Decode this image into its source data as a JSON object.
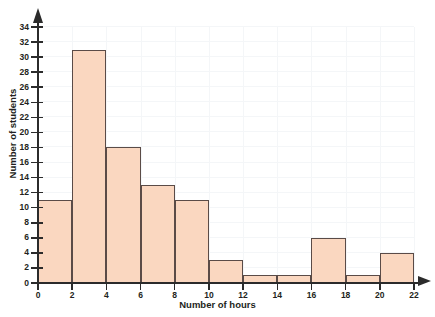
{
  "chart_data": {
    "type": "bar",
    "title": "",
    "subtitle": "",
    "xlabel": "Number of hours",
    "ylabel": "Number of students",
    "xlim": [
      0,
      22
    ],
    "ylim": [
      0,
      34
    ],
    "grid": true,
    "legend": "none",
    "bin_width": 2,
    "bin_edges": [
      0,
      2,
      4,
      6,
      8,
      10,
      12,
      14,
      16,
      18,
      20,
      22
    ],
    "categories": [
      "0-2",
      "2-4",
      "4-6",
      "6-8",
      "8-10",
      "10-12",
      "12-14",
      "14-16",
      "16-18",
      "18-20",
      "20-22"
    ],
    "values": [
      11,
      31,
      18,
      13,
      11,
      3,
      1,
      1,
      6,
      1,
      4
    ],
    "bars": [
      {
        "label": "0-2",
        "start": 0,
        "end": 2,
        "value": 11
      },
      {
        "label": "2-4",
        "start": 2,
        "end": 4,
        "value": 31
      },
      {
        "label": "4-6",
        "start": 4,
        "end": 6,
        "value": 18
      },
      {
        "label": "6-8",
        "start": 6,
        "end": 8,
        "value": 13
      },
      {
        "label": "8-10",
        "start": 8,
        "end": 10,
        "value": 11
      },
      {
        "label": "10-12",
        "start": 10,
        "end": 12,
        "value": 3
      },
      {
        "label": "12-14",
        "start": 12,
        "end": 14,
        "value": 1
      },
      {
        "label": "14-16",
        "start": 14,
        "end": 16,
        "value": 1
      },
      {
        "label": "16-18",
        "start": 16,
        "end": 18,
        "value": 6
      },
      {
        "label": "18-20",
        "start": 18,
        "end": 20,
        "value": 1
      },
      {
        "label": "20-22",
        "start": 20,
        "end": 22,
        "value": 4
      }
    ],
    "xticks": [
      0,
      2,
      4,
      6,
      8,
      10,
      12,
      14,
      16,
      18,
      20,
      22
    ],
    "yticks": [
      0,
      2,
      4,
      6,
      8,
      10,
      12,
      14,
      16,
      18,
      20,
      22,
      24,
      26,
      28,
      30,
      32,
      34
    ],
    "colors": {
      "bar_fill": "#fad7c0",
      "bar_stroke": "#5a4b47",
      "axis": "#2b2b2b",
      "grid": "#f4f6f8",
      "text": "#231f20",
      "background": "#ffffff"
    }
  }
}
